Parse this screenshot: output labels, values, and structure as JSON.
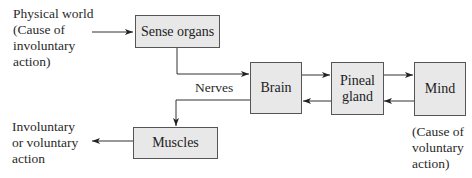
{
  "diagram": {
    "nodes": {
      "sense_organs": "Sense organs",
      "brain": "Brain",
      "pineal_line1": "Pineal",
      "pineal_line2": "gland",
      "mind": "Mind",
      "muscles": "Muscles"
    },
    "labels": {
      "physical_world": [
        "Physical world",
        "(Cause of",
        "involuntary",
        "action)"
      ],
      "action_output": [
        "Involuntary",
        "or voluntary",
        "action"
      ],
      "mind_cause": [
        "(Cause of",
        "voluntary",
        "action)"
      ],
      "nerves": "Nerves"
    },
    "edges": [
      {
        "from": "Physical world",
        "to": "Sense organs"
      },
      {
        "from": "Sense organs",
        "to": "Brain",
        "label": "Nerves"
      },
      {
        "from": "Brain",
        "to": "Pineal gland"
      },
      {
        "from": "Pineal gland",
        "to": "Mind"
      },
      {
        "from": "Mind",
        "to": "Pineal gland"
      },
      {
        "from": "Pineal gland",
        "to": "Brain"
      },
      {
        "from": "Brain",
        "to": "Muscles"
      },
      {
        "from": "Muscles",
        "to": "Involuntary or voluntary action"
      }
    ],
    "colors": {
      "box_fill": "#e8e8e8",
      "box_border": "#555555",
      "line": "#333333"
    }
  }
}
